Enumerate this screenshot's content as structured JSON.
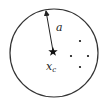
{
  "diagram": {
    "type": "circle-with-center-and-points",
    "circle": {
      "cx": 54,
      "cy": 53,
      "r": 44,
      "stroke": "#333333"
    },
    "center": {
      "x": 53,
      "y": 52,
      "marker": "star-icon"
    },
    "radius_label": {
      "text": "a",
      "x": 56,
      "y": 31
    },
    "center_label": {
      "main": "x",
      "sub": "c",
      "x": 46,
      "y": 70
    },
    "points": [
      {
        "x": 80,
        "y": 41
      },
      {
        "x": 71,
        "y": 56
      },
      {
        "x": 88,
        "y": 56
      },
      {
        "x": 80,
        "y": 67
      }
    ]
  }
}
